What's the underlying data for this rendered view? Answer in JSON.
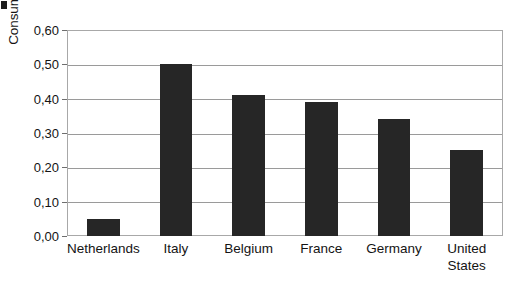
{
  "chart_data": {
    "type": "bar",
    "title": "",
    "xlabel": "",
    "ylabel": "Consumption bottled water (l/p/d)",
    "ylim": [
      0,
      0.6
    ],
    "ytick_step": 0.1,
    "grid": true,
    "legend": "none",
    "decimal_separator": ",",
    "categories": [
      "Netherlands",
      "Italy",
      "Belgium",
      "France",
      "Germany",
      "United States"
    ],
    "category_label_lines": [
      [
        "Netherlands"
      ],
      [
        "Italy"
      ],
      [
        "Belgium"
      ],
      [
        "France"
      ],
      [
        "Germany"
      ],
      [
        "United",
        "States"
      ]
    ],
    "values": [
      0.05,
      0.5,
      0.41,
      0.39,
      0.34,
      0.25
    ],
    "ytick_labels": [
      "0,00",
      "0,10",
      "0,20",
      "0,30",
      "0,40",
      "0,50",
      "0,60"
    ],
    "ytick_values": [
      0.0,
      0.1,
      0.2,
      0.3,
      0.4,
      0.5,
      0.6
    ],
    "bar_color": "#262626",
    "gridline_color": "#9a9a9a",
    "frame_color": "#a8a8a8",
    "background_color": "#ffffff"
  }
}
